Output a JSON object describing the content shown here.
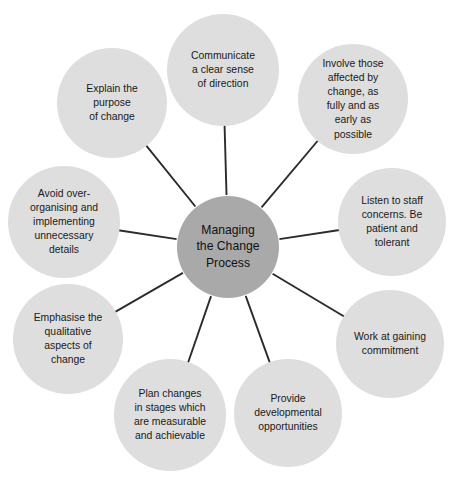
{
  "diagram": {
    "type": "radial-hub-and-spoke",
    "center": {
      "id": "center-node",
      "label": "Managing the Change Process",
      "lines": [
        "Managing",
        "the Change",
        "Process"
      ],
      "cx": 228,
      "cy": 247,
      "r": 51,
      "fill": "#a9a9a9"
    },
    "node_fill": "#dedede",
    "line_color": "#2b2b2b",
    "text_color": "#1a1a1a",
    "background": "#ffffff",
    "nodes": [
      {
        "id": "node-communicate",
        "label": "Communicate a clear sense of direction",
        "lines": [
          "Communicate",
          "a clear sense",
          "of direction"
        ],
        "cx": 223,
        "cy": 70,
        "r": 56,
        "angle": -92
      },
      {
        "id": "node-involve",
        "label": "Involve those affected by change, as fully and as early as possible",
        "lines": [
          "Involve those",
          "affected by",
          "change, as",
          "fully and as",
          "early as",
          "possible"
        ],
        "cx": 353,
        "cy": 99,
        "r": 55,
        "angle": -49
      },
      {
        "id": "node-listen",
        "label": "Listen to staff concerns. Be patient and tolerant",
        "lines": [
          "Listen to staff",
          "concerns. Be",
          "patient and",
          "tolerant"
        ],
        "cx": 392,
        "cy": 222,
        "r": 54,
        "angle": -8
      },
      {
        "id": "node-commitment",
        "label": "Work at gaining commitment",
        "lines": [
          "Work at gaining",
          "commitment"
        ],
        "cx": 390,
        "cy": 344,
        "r": 54,
        "angle": 32
      },
      {
        "id": "node-developmental",
        "label": "Provide developmental opportunities",
        "lines": [
          "Provide",
          "developmental",
          "opportunities"
        ],
        "cx": 288,
        "cy": 413,
        "r": 54,
        "angle": 71
      },
      {
        "id": "node-plan",
        "label": "Plan changes in stages which are measurable and achievable",
        "lines": [
          "Plan changes",
          "in stages which",
          "are measurable",
          "and achievable"
        ],
        "cx": 170,
        "cy": 415,
        "r": 56,
        "angle": 110
      },
      {
        "id": "node-emphasise",
        "label": "Emphasise the qualitative aspects of change",
        "lines": [
          "Emphasise the",
          "qualitative",
          "aspects of",
          "change"
        ],
        "cx": 68,
        "cy": 339,
        "r": 55,
        "angle": 150
      },
      {
        "id": "node-avoid",
        "label": "Avoid over-organising and implementing unnecessary details",
        "lines": [
          "Avoid over-",
          "organising and",
          "implementing",
          "unnecessary",
          "details"
        ],
        "cx": 64,
        "cy": 222,
        "r": 56,
        "angle": 186
      },
      {
        "id": "node-explain",
        "label": "Explain the purpose of change",
        "lines": [
          "Explain the",
          "purpose",
          "of change"
        ],
        "cx": 112,
        "cy": 103,
        "r": 55,
        "angle": 227
      }
    ]
  }
}
